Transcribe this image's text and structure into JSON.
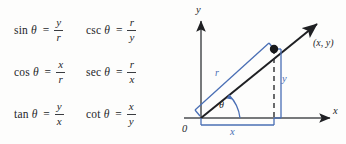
{
  "figure": {
    "type": "trigonometric-definitions-figure",
    "background_color": "#fdfdfc",
    "ink_color": "#25272a",
    "accent_color": "#4a6fb5"
  },
  "formulas": [
    {
      "function": "sin",
      "variable": "θ",
      "equals": "=",
      "numerator": "y",
      "denominator": "r"
    },
    {
      "function": "csc",
      "variable": "θ",
      "equals": "=",
      "numerator": "r",
      "denominator": "y"
    },
    {
      "function": "cos",
      "variable": "θ",
      "equals": "=",
      "numerator": "x",
      "denominator": "r"
    },
    {
      "function": "sec",
      "variable": "θ",
      "equals": "=",
      "numerator": "r",
      "denominator": "x"
    },
    {
      "function": "tan",
      "variable": "θ",
      "equals": "=",
      "numerator": "y",
      "denominator": "x"
    },
    {
      "function": "cot",
      "variable": "θ",
      "equals": "=",
      "numerator": "x",
      "denominator": "y"
    }
  ],
  "diagram": {
    "axis_y_label": "y",
    "axis_x_label": "x",
    "origin_label": "0",
    "point_label": "(x, y)",
    "radius_label": "r",
    "vertical_leg_label": "y",
    "horizontal_leg_label": "x",
    "angle_label": "θ"
  }
}
